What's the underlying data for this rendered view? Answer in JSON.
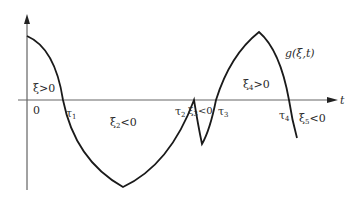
{
  "diagram": {
    "axis_x_label": "t",
    "origin_label": "0",
    "curve_label": "g(ξ,t)",
    "crossings": [
      {
        "sym": "τ",
        "sub": "1"
      },
      {
        "sym": "τ",
        "sub": "2"
      },
      {
        "sym": "τ",
        "sub": "3"
      },
      {
        "sym": "τ",
        "sub": "4"
      }
    ],
    "regions": [
      {
        "sym": "ξ",
        "sub": "",
        "rel": ">0"
      },
      {
        "sym": "ξ",
        "sub": "2",
        "rel": "<0"
      },
      {
        "sym": "ξ",
        "sub": "3",
        "rel": "<0"
      },
      {
        "sym": "ξ",
        "sub": "4",
        "rel": ">0"
      },
      {
        "sym": "ξ",
        "sub": "5",
        "rel": "<0"
      }
    ],
    "colors": {
      "curve": "#1a1a1a",
      "axis": "#555555",
      "background": "#ffffff"
    }
  }
}
